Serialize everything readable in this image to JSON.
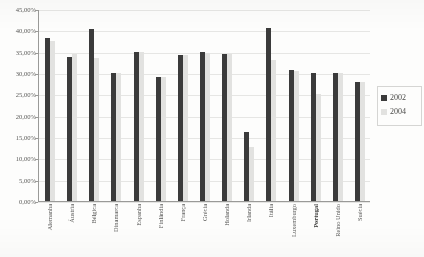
{
  "chart_data": {
    "type": "bar",
    "title": "",
    "xlabel": "",
    "ylabel": "",
    "ylim": [
      0,
      45
    ],
    "ytick_labels": [
      "45,00%",
      "40,00%",
      "35,00%",
      "30,00%",
      "25,00%",
      "20,00%",
      "15,00%",
      "10,00%",
      "5,00%",
      "0,00%"
    ],
    "ytick_values": [
      45,
      40,
      35,
      30,
      25,
      20,
      15,
      10,
      5,
      0
    ],
    "grid": true,
    "legend_position": "right",
    "categories": [
      "Alemanha",
      "Áustria",
      "Bélgica",
      "Dinamarca",
      "Espanha",
      "Finlândia",
      "França",
      "Grécia",
      "Holanda",
      "Irlanda",
      "Itália",
      "Luxemburgo",
      "Portugal",
      "Reino Unido",
      "Suécia"
    ],
    "highlight_category": "Portugal",
    "series": [
      {
        "name": "2002",
        "color": "#3b3b3b",
        "values": [
          38.2,
          33.8,
          40.2,
          30.0,
          35.0,
          29.1,
          34.3,
          35.0,
          34.5,
          16.1,
          40.5,
          30.6,
          30.1,
          30.1,
          28.0
        ]
      },
      {
        "name": "2004",
        "color": "#e2e2e0",
        "values": [
          37.6,
          34.5,
          33.6,
          29.9,
          35.0,
          29.1,
          34.3,
          34.8,
          34.5,
          12.6,
          33.0,
          30.5,
          25.1,
          30.1,
          27.9
        ]
      }
    ]
  },
  "legend": {
    "entries": [
      {
        "label": "2002",
        "swatch": "#3b3b3b"
      },
      {
        "label": "2004",
        "swatch": "#e2e2e0"
      }
    ]
  }
}
